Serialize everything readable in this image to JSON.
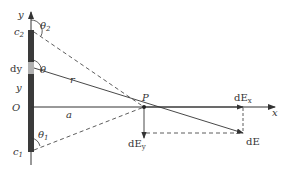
{
  "diagram": {
    "labels": {
      "y_axis": "y",
      "x_axis": "x",
      "origin": "O",
      "point": "P",
      "c2": "c",
      "c2_sub": "2",
      "c1": "c",
      "c1_sub": "1",
      "dy": "dy",
      "y_pos": "y",
      "theta": "θ",
      "theta2": "θ",
      "theta2_sub": "2",
      "theta1": "θ",
      "theta1_sub": "1",
      "r": "r",
      "a": "a",
      "dEx": "dE",
      "dEx_sub": "x",
      "dEy": "dE",
      "dEy_sub": "y",
      "dE": "dE"
    },
    "colors": {
      "rod": "#3a3a3a",
      "segment": "#b0b0b0",
      "line": "#333333"
    }
  }
}
